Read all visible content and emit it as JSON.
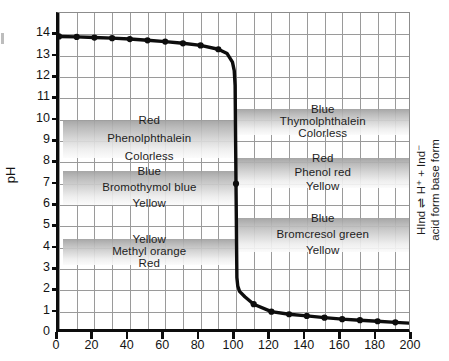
{
  "chart_data": {
    "type": "line",
    "title": "",
    "xlabel": "",
    "ylabel": "pH",
    "xlim": [
      0,
      200
    ],
    "ylim": [
      0,
      15
    ],
    "xticks": [
      0,
      20,
      40,
      60,
      80,
      100,
      120,
      140,
      160,
      180,
      200
    ],
    "yticks": [
      0,
      1,
      2,
      3,
      4,
      5,
      6,
      7,
      8,
      9,
      10,
      11,
      12,
      13,
      14
    ],
    "xtick_labels": [
      "0",
      "20",
      "40",
      "60",
      "80",
      "100",
      "120",
      "140",
      "160",
      "180",
      "200"
    ],
    "ytick_labels": [
      "0",
      "1",
      "2",
      "3",
      "4",
      "5",
      "6",
      "7",
      "8",
      "9",
      "10",
      "11",
      "12",
      "13",
      "14"
    ],
    "grid": true,
    "minor_grid_x_step": 10,
    "legend": "none",
    "series": [
      {
        "name": "Titration curve",
        "marker": "filled-circle",
        "x": [
          0,
          10,
          20,
          30,
          40,
          50,
          60,
          70,
          80,
          90,
          95,
          98,
          99,
          99.5,
          100,
          100.5,
          101,
          102,
          105,
          110,
          120,
          130,
          140,
          150,
          160,
          170,
          180,
          190,
          200
        ],
        "y": [
          13.9,
          13.88,
          13.85,
          13.82,
          13.78,
          13.72,
          13.66,
          13.58,
          13.48,
          13.3,
          13.1,
          12.7,
          12.3,
          11.6,
          7.0,
          2.6,
          2.2,
          1.95,
          1.7,
          1.35,
          1.0,
          0.88,
          0.8,
          0.72,
          0.65,
          0.6,
          0.55,
          0.5,
          0.45
        ]
      }
    ],
    "annotations": {
      "equivalence_volume": 100,
      "equivalence_ph": 7.0
    },
    "indicator_bands": [
      {
        "name": "Phenolphthalein",
        "side": "left",
        "ph_low": 8.2,
        "ph_high": 10.0,
        "x_start": 2,
        "x_end": 100,
        "acid_color_label": "Colorless",
        "base_color_label": "Red"
      },
      {
        "name": "Bromothymol blue",
        "side": "left",
        "ph_low": 6.0,
        "ph_high": 7.6,
        "x_start": 2,
        "x_end": 100,
        "acid_color_label": "Yellow",
        "base_color_label": "Blue"
      },
      {
        "name": "Methyl orange",
        "side": "left",
        "ph_low": 3.2,
        "ph_high": 4.4,
        "x_start": 2,
        "x_end": 100,
        "acid_color_label": "Red",
        "base_color_label": "Yellow"
      },
      {
        "name": "Thymolphthalein",
        "side": "right",
        "ph_low": 9.3,
        "ph_high": 10.5,
        "x_start": 100,
        "x_end": 198,
        "acid_color_label": "Colorless",
        "base_color_label": "Blue"
      },
      {
        "name": "Phenol red",
        "side": "right",
        "ph_low": 6.8,
        "ph_high": 8.2,
        "x_start": 100,
        "x_end": 198,
        "acid_color_label": "Yellow",
        "base_color_label": "Red"
      },
      {
        "name": "Bromcresol green",
        "side": "right",
        "ph_low": 3.8,
        "ph_high": 5.4,
        "x_start": 100,
        "x_end": 198,
        "acid_color_label": "Yellow",
        "base_color_label": "Blue"
      }
    ]
  },
  "axis": {
    "y_label": "pH"
  },
  "side_note": {
    "equation": "HInd ⇌ H⁺ + Ind⁻",
    "forms": "acid form       base form"
  },
  "colors": {
    "axis": "#0d0d0d",
    "grid": "#9a9a9a",
    "curve": "#0d0d0d",
    "band_dark": "#9e9e9e",
    "band_light": "#fbfbfb",
    "text": "#1a1a1a"
  }
}
